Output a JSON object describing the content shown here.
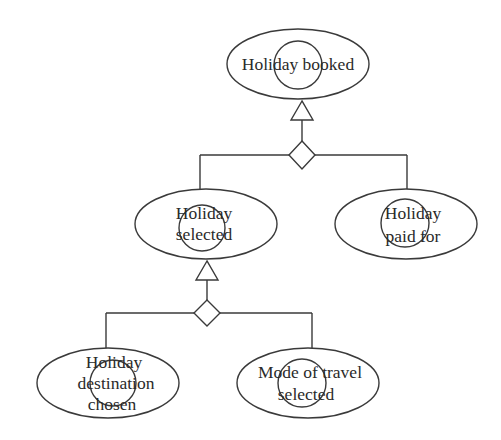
{
  "diagram": {
    "type": "goal-refinement-tree",
    "colors": {
      "stroke": "#3a3a3a",
      "text": "#2a2a2a",
      "background": "#ffffff"
    },
    "nodes": {
      "holiday_booked": {
        "lines": [
          "Holiday booked"
        ]
      },
      "holiday_selected": {
        "lines": [
          "Holiday",
          "selected"
        ]
      },
      "holiday_paid_for": {
        "lines": [
          "Holiday",
          "paid for"
        ]
      },
      "holiday_destination_chosen": {
        "lines": [
          "Holiday",
          "destination",
          "chosen"
        ]
      },
      "mode_of_travel_selected": {
        "lines": [
          "Mode of travel",
          "selected"
        ]
      }
    },
    "refinements": [
      {
        "parent": "Holiday booked",
        "operator": "AND",
        "children": [
          "Holiday selected",
          "Holiday paid for"
        ]
      },
      {
        "parent": "Holiday selected",
        "operator": "AND",
        "children": [
          "Holiday destination chosen",
          "Mode of travel selected"
        ]
      }
    ]
  }
}
